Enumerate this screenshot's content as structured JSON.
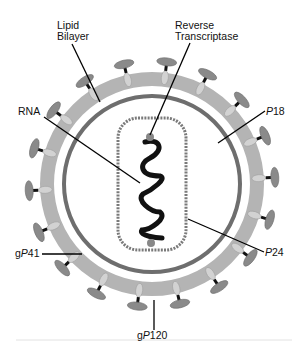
{
  "diagram": {
    "labels": {
      "lipid_bilayer_line1": "Lipid",
      "lipid_bilayer_line2": "Bilayer",
      "reverse_transcriptase_line1": "Reverse",
      "reverse_transcriptase_line2": "Transcriptase",
      "rna": "RNA",
      "p18_prefix": "",
      "p18_italic": "P",
      "p18_num": "18",
      "p24_italic": "P",
      "p24_num": "24",
      "gp41_prefix": "g",
      "gp41_italic": "P",
      "gp41_num": "41",
      "gp120_prefix": "g",
      "gp120_italic": "P",
      "gp120_num": "120"
    },
    "colors": {
      "bilayer": "#b4b4b4",
      "inner_ring": "#6e6e6e",
      "knob": "#8a8a8a",
      "stalk": "#d2d2d2",
      "capsid_dots": "#7a7a7a",
      "rna": "#111111",
      "leader": "#000000"
    }
  }
}
